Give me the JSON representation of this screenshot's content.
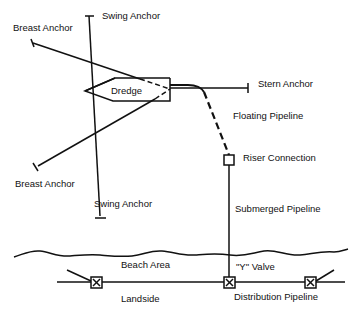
{
  "diagram": {
    "labels": {
      "breast_anchor_top": "Breast Anchor",
      "swing_anchor_top": "Swing Anchor",
      "dredge": "Dredge",
      "stern_anchor": "Stern Anchor",
      "floating_pipeline": "Floating Pipeline",
      "riser_connection": "Riser Connection",
      "breast_anchor_bottom": "Breast Anchor",
      "swing_anchor_bottom": "Swing Anchor",
      "submerged_pipeline": "Submerged Pipeline",
      "beach_area": "Beach Area",
      "y_valve": "\"Y\" Valve",
      "landside": "Landside",
      "distribution_pipeline": "Distribution Pipeline"
    },
    "colors": {
      "line": "#111111",
      "background": "#ffffff"
    }
  }
}
